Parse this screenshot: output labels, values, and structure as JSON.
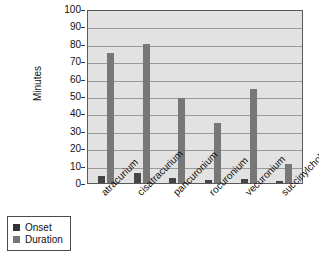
{
  "chart_data": {
    "type": "bar",
    "title": "",
    "xlabel": "",
    "ylabel": "Minutes",
    "ylim": [
      0,
      100
    ],
    "ytick_step": 10,
    "yticks": [
      100,
      90,
      80,
      70,
      60,
      50,
      40,
      30,
      20,
      10,
      0
    ],
    "grid": true,
    "legend_position": "bottom-left",
    "categories": [
      "atracurium",
      "cisatracurium",
      "pancuronium",
      "rocuronium",
      "vecuronium",
      "succinylcholine"
    ],
    "series": [
      {
        "name": "Onset",
        "color": "#454545",
        "values": [
          4,
          6,
          3,
          2,
          2.5,
          1
        ]
      },
      {
        "name": "Duration",
        "color": "#777777",
        "values": [
          75,
          80,
          49,
          34.5,
          54,
          11
        ]
      }
    ]
  },
  "legend": {
    "items": [
      {
        "label": "Onset"
      },
      {
        "label": "Duration"
      }
    ]
  },
  "colors": {
    "onset": "#454545",
    "duration": "#777777",
    "plot_background": "#e2e2e2",
    "gridline": "#9a9a9a",
    "axis": "#5a5a5a",
    "text": "#111111",
    "page_background": "#ffffff"
  }
}
